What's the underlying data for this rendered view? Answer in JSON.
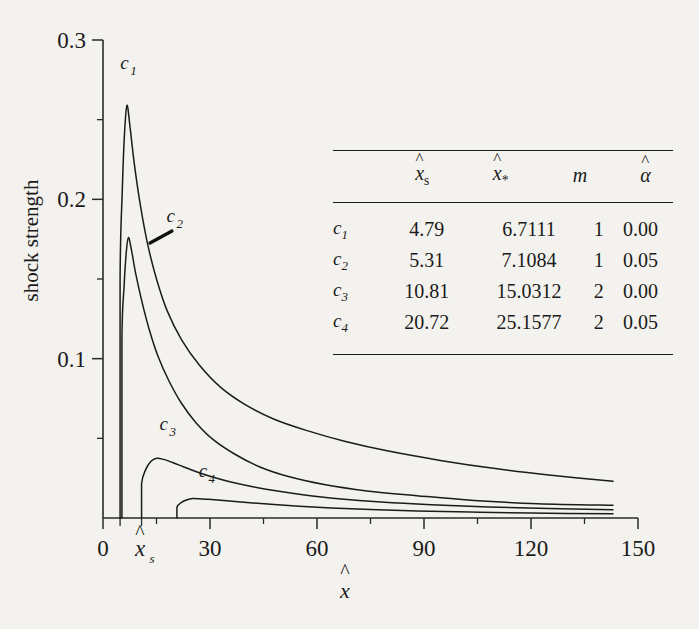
{
  "figure": {
    "y_axis_title": "shock strength",
    "x_axis_title_base": "x",
    "x_axis_title_hat": "^",
    "axis": {
      "x_ticks": [
        "0",
        "30",
        "60",
        "90",
        "120",
        "150"
      ],
      "y_ticks": [
        "0.1",
        "0.2",
        "0.3"
      ],
      "x_special_tick_base": "x",
      "x_special_tick_sub": "s",
      "x_special_tick_hat": "^"
    },
    "curve_labels": [
      "c1",
      "c2",
      "c3",
      "c4"
    ]
  },
  "table": {
    "columns": [
      "",
      "x̂s",
      "x̂*",
      "m",
      "α̂"
    ],
    "col_header_1_base": "x",
    "col_header_1_sub": "s",
    "col_header_2_base": "x",
    "col_header_2_sub": "*",
    "col_header_3": "m",
    "col_header_4": "α",
    "rows": [
      {
        "name": "c",
        "idx": "1",
        "xs": "4.79",
        "xstar": "6.7111",
        "m": "1",
        "alpha": "0.00"
      },
      {
        "name": "c",
        "idx": "2",
        "xs": "5.31",
        "xstar": "7.1084",
        "m": "1",
        "alpha": "0.05"
      },
      {
        "name": "c",
        "idx": "3",
        "xs": "10.81",
        "xstar": "15.0312",
        "m": "2",
        "alpha": "0.00"
      },
      {
        "name": "c",
        "idx": "4",
        "xs": "20.72",
        "xstar": "25.1577",
        "m": "2",
        "alpha": "0.05"
      }
    ]
  },
  "chart_data": {
    "type": "line",
    "title": "",
    "xlabel": "x̂",
    "ylabel": "shock strength",
    "xlim": [
      0,
      150
    ],
    "ylim": [
      0,
      0.3
    ],
    "xticks": [
      0,
      30,
      60,
      90,
      120,
      150
    ],
    "yticks": [
      0.1,
      0.2,
      0.3
    ],
    "xminorticks": [
      15,
      45,
      75,
      105,
      135
    ],
    "yminorticks": [
      0.05,
      0.15,
      0.25
    ],
    "grid": false,
    "legend": "inline-curve-labels",
    "annotations": [
      {
        "text": "c1",
        "x": 6.0,
        "y": 0.282
      },
      {
        "text": "c2",
        "x": 19.0,
        "y": 0.186
      },
      {
        "text": "c3",
        "x": 17.0,
        "y": 0.055
      },
      {
        "text": "c4",
        "x": 28.0,
        "y": 0.026
      }
    ],
    "series": [
      {
        "name": "c1",
        "onset_x": 4.79,
        "peak": {
          "x": 6.7111,
          "y": 0.259
        },
        "x": [
          4.79,
          4.79,
          5.4,
          6.0,
          6.7111,
          7.6,
          8.8,
          10.5,
          12.5,
          15,
          18,
          22,
          27,
          33,
          40,
          48,
          57,
          68,
          80,
          95,
          110,
          125,
          143
        ],
        "y": [
          0.0,
          0.15,
          0.205,
          0.24,
          0.259,
          0.245,
          0.222,
          0.196,
          0.172,
          0.15,
          0.13,
          0.112,
          0.096,
          0.082,
          0.071,
          0.062,
          0.055,
          0.048,
          0.042,
          0.036,
          0.031,
          0.027,
          0.023
        ]
      },
      {
        "name": "c2",
        "onset_x": 5.31,
        "peak": {
          "x": 7.1084,
          "y": 0.176
        },
        "x": [
          5.31,
          5.31,
          5.9,
          6.5,
          7.1084,
          8.0,
          9.2,
          11.0,
          13.0,
          15.5,
          18.5,
          22,
          26,
          31,
          37,
          44,
          52,
          62,
          74,
          88,
          104,
          122,
          143
        ],
        "y": [
          0.0,
          0.112,
          0.145,
          0.166,
          0.176,
          0.168,
          0.153,
          0.135,
          0.118,
          0.101,
          0.086,
          0.072,
          0.06,
          0.049,
          0.04,
          0.032,
          0.026,
          0.021,
          0.017,
          0.014,
          0.011,
          0.009,
          0.008
        ]
      },
      {
        "name": "c3",
        "onset_x": 10.81,
        "peak": {
          "x": 15.0312,
          "y": 0.0375
        },
        "x": [
          10.81,
          10.81,
          12.0,
          13.4,
          15.0312,
          17.0,
          19.5,
          22.5,
          26,
          30,
          35,
          41,
          48,
          56,
          66,
          78,
          92,
          108,
          125,
          143
        ],
        "y": [
          0.0,
          0.0215,
          0.0305,
          0.0355,
          0.0375,
          0.0368,
          0.0348,
          0.0322,
          0.0292,
          0.0262,
          0.0231,
          0.0201,
          0.0172,
          0.0146,
          0.0121,
          0.01,
          0.0083,
          0.0069,
          0.0059,
          0.0052
        ]
      },
      {
        "name": "c4",
        "onset_x": 20.72,
        "peak": {
          "x": 25.1577,
          "y": 0.0122
        },
        "x": [
          20.72,
          20.72,
          22.0,
          23.6,
          25.1577,
          27,
          29.5,
          33,
          37,
          42,
          48,
          55,
          64,
          75,
          88,
          103,
          120,
          143
        ],
        "y": [
          0.0,
          0.0068,
          0.0098,
          0.0115,
          0.0122,
          0.0121,
          0.0117,
          0.0111,
          0.0103,
          0.0094,
          0.0084,
          0.0074,
          0.0063,
          0.0053,
          0.0044,
          0.0037,
          0.0031,
          0.0026
        ]
      }
    ]
  }
}
